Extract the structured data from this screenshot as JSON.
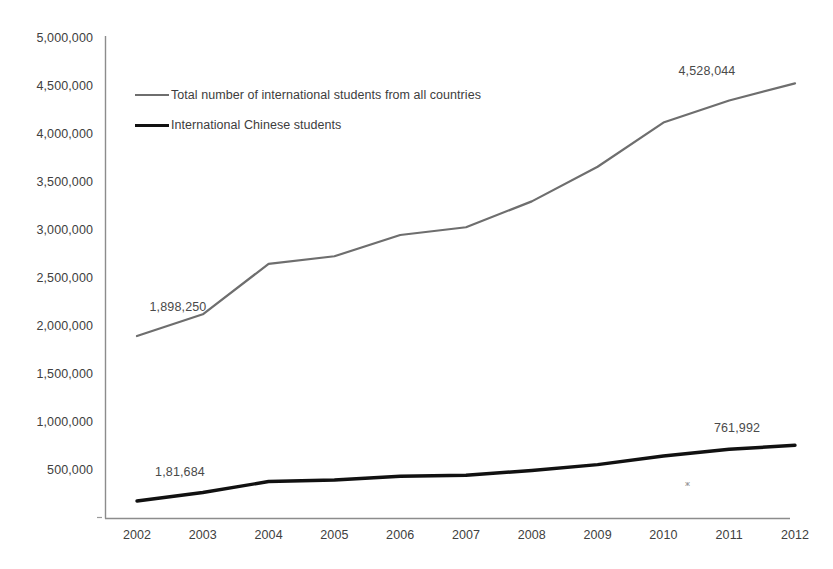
{
  "chart_data": {
    "type": "line",
    "title": "",
    "subtitle": "",
    "xlabel": "",
    "ylabel": "",
    "categories": [
      "2002",
      "2003",
      "2004",
      "2005",
      "2006",
      "2007",
      "2008",
      "2009",
      "2010",
      "2011",
      "2012"
    ],
    "x": [
      2002,
      2003,
      2004,
      2005,
      2006,
      2007,
      2008,
      2009,
      2010,
      2011,
      2012
    ],
    "ylim": [
      0,
      5000000
    ],
    "xlim": [
      2002,
      2012
    ],
    "grid": false,
    "legend_position": "inside-top-left",
    "y_ticks": [
      0,
      500000,
      1000000,
      1500000,
      2000000,
      2500000,
      3000000,
      3500000,
      4000000,
      4500000,
      5000000
    ],
    "y_tick_labels": [
      "",
      "500,000",
      "1,000,000",
      "1,500,000",
      "2,000,000",
      "2,500,000",
      "3,000,000",
      "3,500,000",
      "4,000,000",
      "4,500,000",
      "5,000,000"
    ],
    "series": [
      {
        "name": "Total number of international students from all countries",
        "color": "#6e6e6e",
        "width": 2.2,
        "values": [
          1898250,
          2125000,
          2650000,
          2729000,
          2950000,
          3031000,
          3300000,
          3660000,
          4120000,
          4350000,
          4528044
        ]
      },
      {
        "name": "International Chinese students",
        "color": "#111111",
        "width": 3.4,
        "values": [
          181684,
          270000,
          385000,
          400000,
          440000,
          450000,
          500000,
          560000,
          650000,
          720000,
          761992
        ]
      }
    ],
    "annotations": [
      {
        "text": "1,898,250",
        "series": "Total number of international students from all countries",
        "x": 2002,
        "value": 1898250,
        "anchor_x": 178,
        "anchor_y": 300
      },
      {
        "text": "4,528,044",
        "series": "Total number of international students from all countries",
        "x": 2012,
        "value": 4528044,
        "anchor_x": 707,
        "anchor_y": 64
      },
      {
        "text": "1,81,684",
        "series": "International Chinese students",
        "x": 2002,
        "value": 181684,
        "anchor_x": 180,
        "anchor_y": 465
      },
      {
        "text": "761,992",
        "series": "International Chinese students",
        "x": 2012,
        "value": 761992,
        "anchor_x": 737,
        "anchor_y": 421
      }
    ]
  },
  "legend": {
    "items": [
      {
        "label": "Total number of international students from all countries",
        "swatch": "total"
      },
      {
        "label": "International Chinese students",
        "swatch": "chinese"
      }
    ]
  },
  "axes": {
    "y_labels": [
      "5,000,000",
      "4,500,000",
      "4,000,000",
      "3,500,000",
      "3,000,000",
      "2,500,000",
      "2,000,000",
      "1,500,000",
      "1,000,000",
      "500,000"
    ],
    "x_labels": [
      "2002",
      "2003",
      "2004",
      "2005",
      "2006",
      "2007",
      "2008",
      "2009",
      "2010",
      "2011",
      "2012"
    ]
  },
  "colors": {
    "axis": "#808080",
    "total_series": "#6e6e6e",
    "chinese_series": "#111111",
    "text": "#3d3d3d",
    "background": "#ffffff"
  }
}
